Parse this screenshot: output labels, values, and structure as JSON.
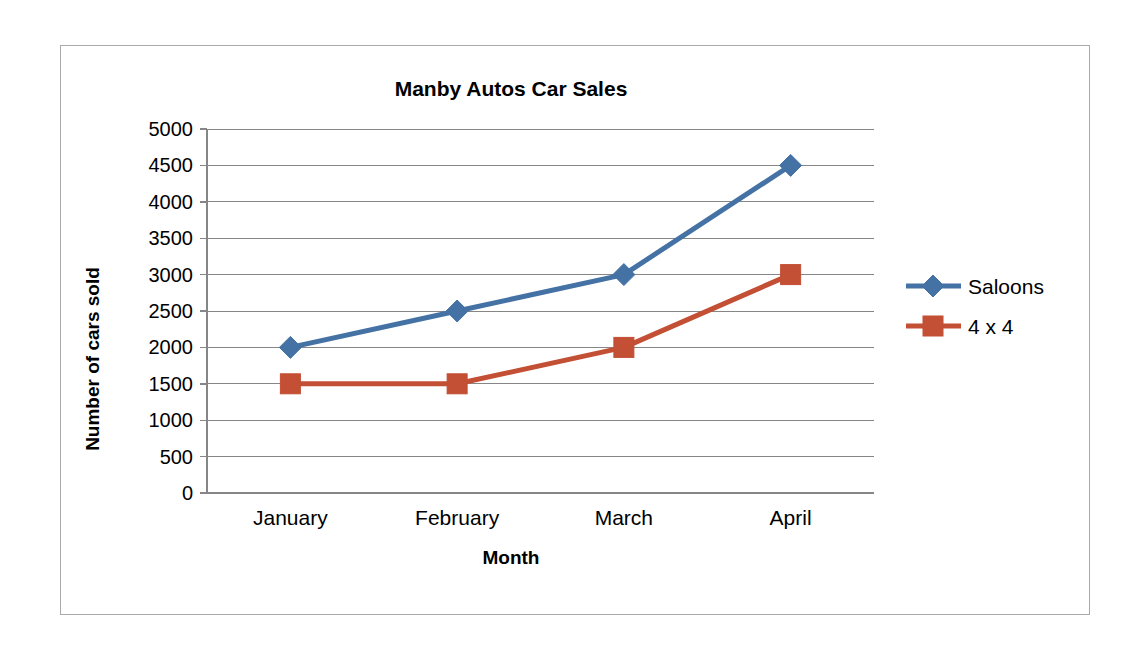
{
  "chart_data": {
    "type": "line",
    "title": "Manby Autos Car Sales",
    "xlabel": "Month",
    "ylabel": "Number of cars sold",
    "categories": [
      "January",
      "February",
      "March",
      "April"
    ],
    "series": [
      {
        "name": "Saloons",
        "values": [
          2000,
          2500,
          3000,
          4500
        ],
        "color": "#4472A4",
        "marker": "diamond"
      },
      {
        "name": "4 x 4",
        "values": [
          1500,
          1500,
          2000,
          3000
        ],
        "color": "#C34F34",
        "marker": "square"
      }
    ],
    "ylim": [
      0,
      5000
    ],
    "ytick_step": 500,
    "yticks": [
      0,
      500,
      1000,
      1500,
      2000,
      2500,
      3000,
      3500,
      4000,
      4500,
      5000
    ],
    "ytick_labels": [
      "0",
      "500",
      "1000",
      "1500",
      "2000",
      "2500",
      "3000",
      "3500",
      "4000",
      "4500",
      "5000"
    ],
    "grid": true,
    "legend_position": "right",
    "plot_background": "#FFFFFF",
    "gridline_color": "#868686",
    "border_color": "#AAAAAC"
  }
}
